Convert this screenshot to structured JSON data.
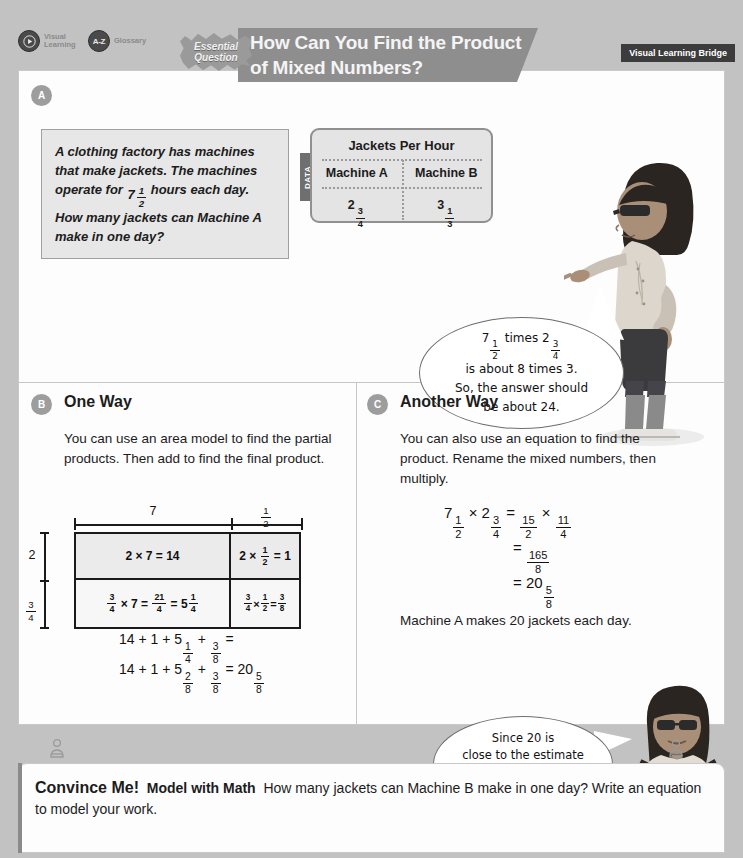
{
  "header": {
    "tools": [
      {
        "icon": "video-icon",
        "glyph": "◉",
        "label": "Visual Learning"
      },
      {
        "icon": "az-glossary-icon",
        "glyph": "A-Z",
        "label": "Glossary"
      }
    ],
    "essential_question_line1": "Essential",
    "essential_question_line2": "Question",
    "title_line1": "How Can You Find the Product",
    "title_line2": "of Mixed Numbers?",
    "bridge_badge": "Visual Learning Bridge"
  },
  "sections": {
    "a": {
      "marker": "A",
      "problem": "A clothing factory has machines that make jackets. The machines operate for 7½ hours each day. How many jackets can Machine A make in one day?",
      "problem_part1": "A clothing factory has machines that make jackets. The machines operate for ",
      "problem_mixed": {
        "whole": "7",
        "num": "1",
        "den": "2"
      },
      "problem_part2": " hours each day. How many jackets can Machine A make in one day?",
      "data_tab": "DATA",
      "table": {
        "title": "Jackets Per Hour",
        "headers": [
          "Machine A",
          "Machine B"
        ],
        "values": [
          {
            "whole": "2",
            "num": "3",
            "den": "4"
          },
          {
            "whole": "3",
            "num": "1",
            "den": "3"
          }
        ]
      },
      "bubble": {
        "line1_pre": "7",
        "line1_f1": {
          "num": "1",
          "den": "2"
        },
        "line1_mid": " times 2",
        "line1_f2": {
          "num": "3",
          "den": "4"
        },
        "line2": "is about 8 times 3.",
        "line3": "So, the answer should",
        "line4": "be about 24."
      }
    },
    "b": {
      "marker": "B",
      "heading": "One Way",
      "body": "You can use an area model to find the partial products. Then add to find the final product.",
      "area_model": {
        "col_labels": [
          {
            "text": "7"
          },
          {
            "num": "1",
            "den": "2"
          }
        ],
        "row_labels": [
          {
            "text": "2"
          },
          {
            "num": "3",
            "den": "4"
          }
        ],
        "cells": [
          {
            "id": "r1c1",
            "text": "2 × 7 = 14"
          },
          {
            "id": "r1c2",
            "text": "2 × 1/2 = 1"
          },
          {
            "id": "r2c1",
            "text": "3/4 × 7 = 21/4 = 5 1/4"
          },
          {
            "id": "r2c2",
            "text": "3/4 × 1/2 = 3/8"
          }
        ]
      },
      "sum_line1": "14 + 1 + 5 1/4 + 3/8 =",
      "sum_line2": "14 + 1 + 5 2/8 + 3/8 = 20 5/8"
    },
    "c": {
      "marker": "C",
      "heading": "Another Way",
      "body": "You can also use an equation to find the product. Rename the mixed numbers, then multiply.",
      "eq_line1": "7 1/2 × 2 3/4 = 15/2 × 11/4",
      "eq_line2": "= 165/8",
      "eq_line3": "= 20 5/8",
      "conclusion": "Machine A makes 20 jackets each day.",
      "bubble": {
        "line1": "Since 20 is",
        "line2": "close to the estimate",
        "line3": "of 24, the answer",
        "line4": "is reasonable."
      }
    }
  },
  "convince_me": {
    "label": "Convince Me!",
    "practice": "Model with Math",
    "question_line1": "How many jackets can Machine B",
    "question_line2": "make in one day? Write an equation to model your work."
  },
  "colors": {
    "page_bg": "#c2c2c2",
    "canvas": "#fdfdfd",
    "accent_gray": "#8e8e8e",
    "marker": "#9d9d9d",
    "badge_dark": "#3c3c3c",
    "problem_box": "#e7e7e7",
    "table_bg": "#e4e4e4"
  }
}
